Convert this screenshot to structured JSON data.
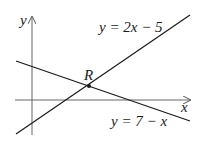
{
  "diagram": {
    "axes": {
      "x_label": "x",
      "y_label": "y"
    },
    "lines": [
      {
        "equation": "y = 2x − 5",
        "slope": 2,
        "intercept": -5
      },
      {
        "equation": "y = 7 − x",
        "slope": -1,
        "intercept": 7
      }
    ],
    "intersection": {
      "label": "R"
    },
    "colors": {
      "line": "#1a1a1a",
      "axis": "#555555",
      "background": "#ffffff"
    }
  }
}
